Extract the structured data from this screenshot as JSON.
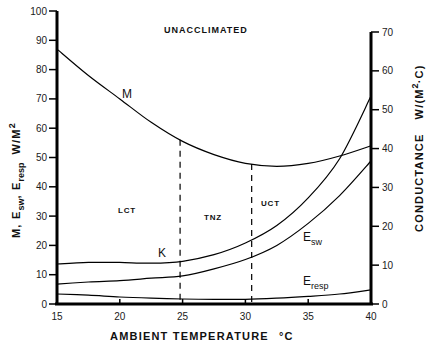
{
  "chart_data": {
    "type": "line",
    "title": "UNACCLIMATED",
    "xlabel": "AMBIENT TEMPERATURE °C",
    "ylabel": "M, Esw, Eresp W/M²",
    "ylabel_right": "CONDUCTANCE W/(M²·C)",
    "xlim": [
      15,
      40
    ],
    "ylim": [
      0,
      100
    ],
    "ylim_right": [
      0,
      70
    ],
    "x_ticks": [
      15,
      20,
      25,
      30,
      35,
      40
    ],
    "y_ticks": [
      0,
      10,
      20,
      30,
      40,
      50,
      60,
      70,
      80,
      90,
      100
    ],
    "y_ticks_right": [
      0,
      10,
      20,
      30,
      40,
      50,
      60,
      70
    ],
    "grid": false,
    "legend": "inline curve labels",
    "x": [
      15,
      17.5,
      20,
      22.5,
      25,
      27.5,
      30,
      32.5,
      35,
      37.5,
      40
    ],
    "series": [
      {
        "name": "M",
        "axis": "left",
        "label": "M",
        "values": [
          87,
          78,
          70,
          62,
          55.5,
          51,
          48,
          47,
          48,
          50.5,
          54
        ]
      },
      {
        "name": "K",
        "axis": "right",
        "label": "K",
        "values": [
          10.3,
          10.7,
          10.7,
          10.5,
          11.0,
          12.7,
          15.7,
          20.2,
          27.3,
          37.4,
          53.5
        ]
      },
      {
        "name": "Esw",
        "axis": "left",
        "label": "E",
        "sub": "sw",
        "values": [
          6.8,
          7.5,
          8,
          8.8,
          9.6,
          12,
          15.2,
          20,
          27.5,
          37,
          48.8
        ]
      },
      {
        "name": "Eresp",
        "axis": "left",
        "label": "E",
        "sub": "resp",
        "values": [
          3.4,
          3.0,
          2.4,
          2.0,
          1.7,
          1.6,
          1.6,
          2.0,
          2.6,
          3.4,
          4.8
        ]
      }
    ],
    "annotations": [
      {
        "text": "LCT",
        "x": 19.5,
        "y": 31,
        "note": "lower critical temperature zone label"
      },
      {
        "text": "TNZ",
        "x": 27.3,
        "y": 28,
        "note": "thermoneutral zone label"
      },
      {
        "text": "UCT",
        "x": 31.8,
        "y": 31,
        "note": "upper critical temperature zone label"
      }
    ],
    "reference_lines": [
      {
        "type": "vertical-dashed",
        "x": 24.8,
        "label": "LCT"
      },
      {
        "type": "vertical-dashed",
        "x": 30.5,
        "label": "UCT"
      }
    ]
  },
  "labels": {
    "title": "UNACCLIMATED",
    "xlabel": "AMBIENT TEMPERATURE",
    "xunit": "°C",
    "ylabel_main": "M,  E",
    "ylabel_sw": "sw",
    "ylabel_comma": ",  E",
    "ylabel_resp": "resp",
    "ylabel_unit": "W/M",
    "ylabel_sup": "2",
    "yrlabel_main": "CONDUCTANCE",
    "yrlabel_unit": "W/(M",
    "yrlabel_sup": "2",
    "yrlabel_end": "·C)",
    "lct": "LCT",
    "tnz": "TNZ",
    "uct": "UCT",
    "m": "M",
    "k": "K",
    "e": "E",
    "sw": "sw",
    "resp": "resp"
  }
}
